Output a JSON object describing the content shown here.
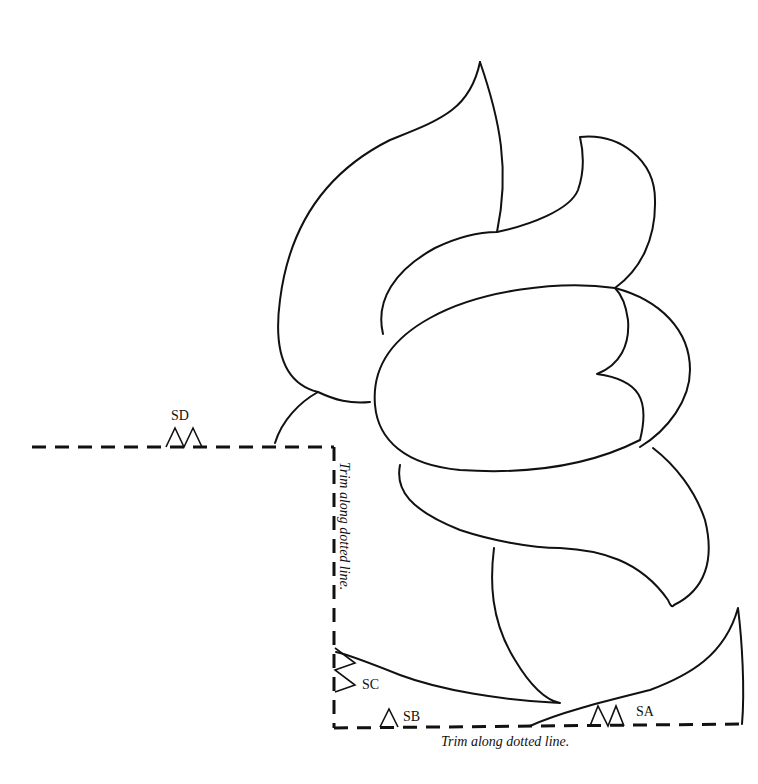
{
  "pattern": {
    "notch_labels": {
      "sd": "SD",
      "sc": "SC",
      "sb": "SB",
      "sa": "SA"
    },
    "trim_vertical": "Trim along dotted line.",
    "trim_bottom": "Trim along dotted line.",
    "colors": {
      "line": "#111111",
      "background": "#ffffff"
    }
  }
}
